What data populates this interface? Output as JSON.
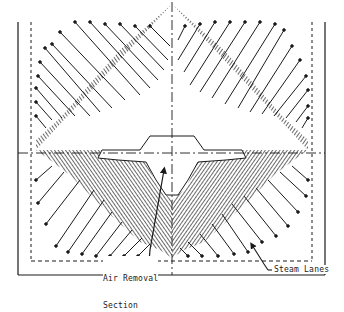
{
  "figure": {
    "type": "condenser tube bundle cross-section",
    "colors": {
      "ink": "#1a1a1a",
      "background": "#ffffff"
    },
    "labels": {
      "air_removal_line1": "Air Removal",
      "air_removal_line2": "Section",
      "steam_lanes": "Steam Lanes"
    },
    "elements": [
      {
        "name": "outer-shell-frame",
        "style": "solid"
      },
      {
        "name": "inner-boundary",
        "style": "dashed"
      },
      {
        "name": "horizontal-centerline",
        "style": "dash-dot"
      },
      {
        "name": "vertical-centerline",
        "style": "dash-dot"
      },
      {
        "name": "tube-bundle",
        "style": "hatched dense tube array"
      },
      {
        "name": "steam-lanes",
        "style": "radial tube rows with open lanes"
      },
      {
        "name": "air-removal-section",
        "style": "central open cavity"
      }
    ]
  }
}
